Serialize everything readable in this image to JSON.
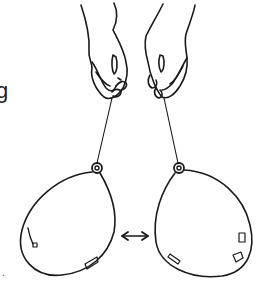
{
  "illustration": {
    "subject": "two hands holding balloons on strings with a double-headed arrow between balloons",
    "edge_text_fragment": "g",
    "edge_dot": ".",
    "ink_color": "#1a1a1a",
    "background": "#ffffff"
  }
}
